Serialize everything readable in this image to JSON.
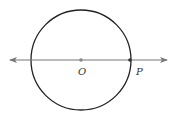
{
  "diagram": {
    "circle": {
      "cx": 81,
      "cy": 60,
      "r": 50,
      "stroke": "#222222"
    },
    "line": {
      "x1": 10,
      "x2": 167,
      "y": 60,
      "stroke": "#777777",
      "arrows": "both"
    },
    "points": [
      {
        "name": "O",
        "x": 81,
        "y": 60,
        "label": "O",
        "label_x": 78,
        "label_y": 75,
        "color": "#888888"
      },
      {
        "name": "P",
        "x": 130,
        "y": 60,
        "label": "P",
        "label_x": 136,
        "label_y": 75,
        "color": "#333333"
      }
    ]
  }
}
